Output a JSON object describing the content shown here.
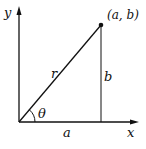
{
  "diagram": {
    "type": "polar-coordinates",
    "colors": {
      "stroke": "#111111",
      "background": "#ffffff"
    },
    "labels": {
      "y_axis": "y",
      "x_axis": "x",
      "point": "(a, b)",
      "radius": "r",
      "vertical_side": "b",
      "horizontal_side": "a",
      "angle": "θ"
    },
    "geometry": {
      "origin": [
        19,
        122
      ],
      "y_axis_top": [
        19,
        8
      ],
      "x_axis_right": [
        138,
        122
      ],
      "point": [
        101,
        25
      ]
    }
  }
}
